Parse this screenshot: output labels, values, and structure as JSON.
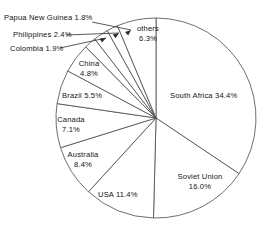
{
  "chart_data": {
    "type": "pie",
    "title": "",
    "subtitle": "",
    "xlabel": "",
    "ylabel": "",
    "legend_position": "none",
    "grid": false,
    "units": "percent",
    "start_angle_deg": 0,
    "direction": "clockwise",
    "categories": [
      "South Africa",
      "Soviet Union",
      "USA",
      "Australia",
      "Canada",
      "Brazil",
      "China",
      "Colombia",
      "Philippines",
      "Papua New Guinea",
      "others"
    ],
    "values": [
      34.4,
      16.0,
      11.4,
      8.4,
      7.1,
      5.5,
      4.8,
      1.9,
      2.4,
      1.8,
      6.3
    ],
    "slices": [
      {
        "label": "South Africa",
        "value": 34.4,
        "value_text": "34.4%",
        "label_text": "South Africa   34.4%"
      },
      {
        "label": "Soviet Union",
        "value": 16.0,
        "value_text": "16.0%",
        "label_text": "Soviet Union"
      },
      {
        "label": "USA",
        "value": 11.4,
        "value_text": "11.4%",
        "label_text": "USA   11.4%"
      },
      {
        "label": "Australia",
        "value": 8.4,
        "value_text": "8.4%",
        "label_text": "Australia"
      },
      {
        "label": "Canada",
        "value": 7.1,
        "value_text": "7.1%",
        "label_text": "Canada"
      },
      {
        "label": "Brazil",
        "value": 5.5,
        "value_text": "5.5%",
        "label_text": "Brazil   5.5%"
      },
      {
        "label": "China",
        "value": 4.8,
        "value_text": "4.8%",
        "label_text": "China"
      },
      {
        "label": "Colombia",
        "value": 1.9,
        "value_text": "1.9%",
        "label_text": "Colombia   1.9%"
      },
      {
        "label": "Philippines",
        "value": 2.4,
        "value_text": "2.4%",
        "label_text": "Philippines   2.4%"
      },
      {
        "label": "Papua New Guinea",
        "value": 1.8,
        "value_text": "1.8%",
        "label_text": "Papua New Guinea  1.8%"
      },
      {
        "label": "others",
        "value": 6.3,
        "value_text": "6.3%",
        "label_text": "others"
      }
    ]
  },
  "labels": {
    "papua_new_guinea": "Papua New Guinea  1.8%",
    "philippines": "Philippines   2.4%",
    "colombia": "Colombia   1.9%",
    "others_name": "others",
    "others_pct": "6.3%",
    "china_name": "China",
    "china_pct": "4.8%",
    "brazil": "Brazil   5.5%",
    "canada_name": "Canada",
    "canada_pct": "7.1%",
    "australia_name": "Australia",
    "australia_pct": "8.4%",
    "usa": "USA   11.4%",
    "south_africa": "South Africa   34.4%",
    "soviet_union_name": "Soviet Union",
    "soviet_union_pct": "16.0%"
  },
  "colors": {
    "slice_fill": "#ffffff",
    "slice_stroke": "#4a4a4a",
    "text": "#141414",
    "background": "#ffffff"
  }
}
